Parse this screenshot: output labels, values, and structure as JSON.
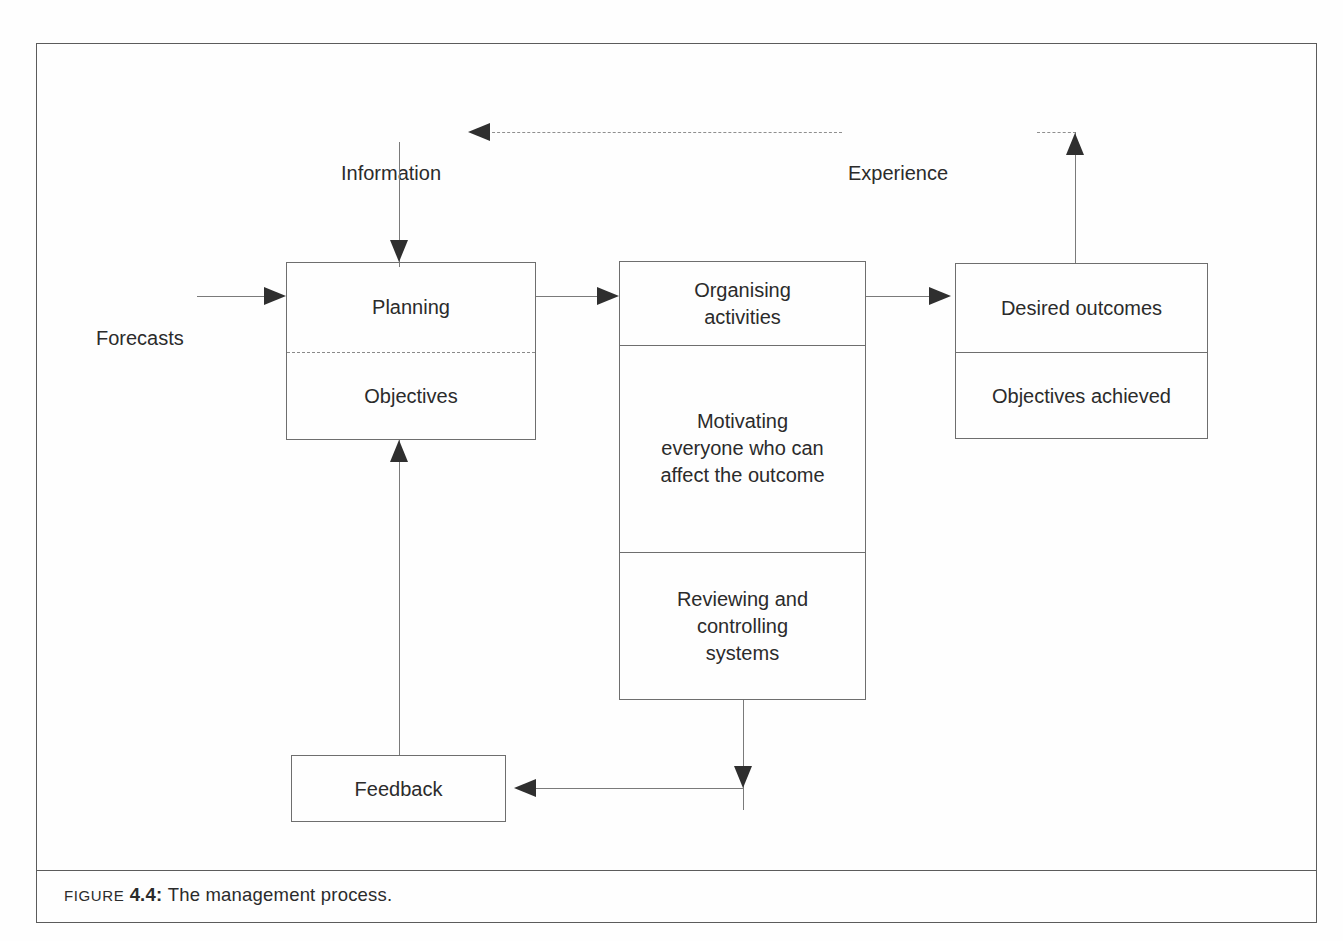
{
  "figure": {
    "caption_prefix": "Figure",
    "caption_number": "4.4:",
    "caption_text": "The management process."
  },
  "diagram": {
    "title": "The management process",
    "external_labels": {
      "forecasts": "Forecasts",
      "information": "Information",
      "experience": "Experience"
    },
    "boxes": {
      "planning": {
        "cells": [
          {
            "label": "Planning"
          },
          {
            "label": "Objectives"
          }
        ],
        "divider_style": "dashed"
      },
      "organising": {
        "cells": [
          {
            "label": "Organising\nactivities"
          },
          {
            "label": "Motivating\neveryone who can\naffect the outcome"
          },
          {
            "label": "Reviewing and\ncontrolling\nsystems"
          }
        ],
        "divider_style": "solid"
      },
      "outcomes": {
        "cells": [
          {
            "label": "Desired outcomes"
          },
          {
            "label": "Objectives achieved"
          }
        ],
        "divider_style": "solid"
      },
      "feedback": {
        "cells": [
          {
            "label": "Feedback"
          }
        ]
      }
    },
    "connectors": [
      {
        "name": "forecasts-to-planning",
        "from": "Forecasts",
        "to": "Planning",
        "style": "solid"
      },
      {
        "name": "information-to-planning",
        "from": "Information",
        "to": "Planning",
        "style": "solid"
      },
      {
        "name": "planning-to-organising",
        "from": "Planning",
        "to": "Organising activities",
        "style": "solid"
      },
      {
        "name": "organising-to-outcomes",
        "from": "Organising activities",
        "to": "Desired outcomes",
        "style": "solid"
      },
      {
        "name": "outcomes-to-experience",
        "from": "Desired outcomes",
        "to": "Experience",
        "style": "solid"
      },
      {
        "name": "experience-to-information",
        "from": "Experience",
        "to": "Information",
        "style": "dashed"
      },
      {
        "name": "organising-to-feedback",
        "from": "Reviewing and controlling systems",
        "to": "Feedback",
        "style": "solid"
      },
      {
        "name": "feedback-to-planning",
        "from": "Feedback",
        "to": "Planning",
        "style": "solid"
      }
    ],
    "colors": {
      "frame": "#5b5b5b",
      "box_border": "#6e6e6e",
      "line": "#7a7a7a",
      "arrowhead": "#2f2f2f",
      "text": "#2b2b2b",
      "background": "#fefefe"
    }
  }
}
